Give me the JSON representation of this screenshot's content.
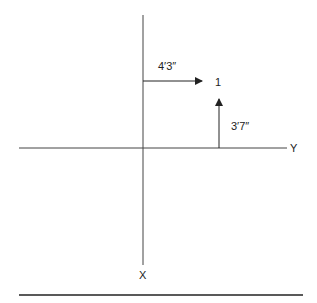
{
  "diagram": {
    "axes": {
      "x_label": "X",
      "y_label": "Y"
    },
    "point": {
      "label": "1"
    },
    "offsets": {
      "along_y": "4′3″",
      "along_x": "3′7″"
    }
  }
}
